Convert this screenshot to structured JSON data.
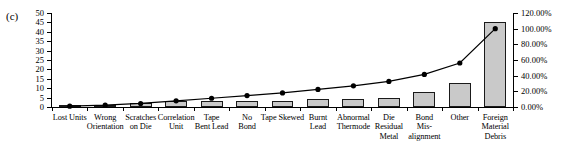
{
  "panel": {
    "label": "(c)"
  },
  "chart_data": {
    "type": "bar",
    "title": "",
    "subtitle": "",
    "xlabel": "",
    "ylabel": "",
    "grid": false,
    "legend": "none",
    "categories": [
      "Lost Units",
      "Wrong Orientation",
      "Scratches on Die",
      "Correlation Unit",
      "Tape Bent Lead",
      "No Bond",
      "Tape Skewed",
      "Burnt Lead",
      "Abnormal Thermode",
      "Die Residual Metal",
      "Bond Mis-alignment",
      "Other",
      "Foreign Material Debris"
    ],
    "category_lines": [
      [
        "Lost Units"
      ],
      [
        "Wrong",
        "Orientation"
      ],
      [
        "Scratches",
        "on Die"
      ],
      [
        "Correlation",
        "Unit"
      ],
      [
        "Tape",
        "Bent Lead"
      ],
      [
        "No",
        "Bond"
      ],
      [
        "Tape Skewed"
      ],
      [
        "Burnt",
        "Lead"
      ],
      [
        "Abnormal",
        "Thermode"
      ],
      [
        "Die",
        "Residual",
        "Metal"
      ],
      [
        "Bond",
        "Mis-",
        "alignment"
      ],
      [
        "Other"
      ],
      [
        "Foreign",
        "Material",
        "Debris"
      ]
    ],
    "series": [
      {
        "name": "Count",
        "type": "bar",
        "axis": "left",
        "values": [
          1,
          1,
          2,
          3,
          3,
          3,
          3,
          4,
          4,
          5,
          8,
          13,
          45
        ]
      },
      {
        "name": "Cumulative Percentage",
        "type": "line",
        "axis": "right",
        "values": [
          1.1,
          2.3,
          4.5,
          7.9,
          11.2,
          14.6,
          18.0,
          22.5,
          27.0,
          32.6,
          41.6,
          56.2,
          100.0
        ]
      }
    ],
    "left_axis": {
      "min": 0,
      "max": 50,
      "step": 5,
      "ticks": [
        "0",
        "5",
        "10",
        "15",
        "20",
        "25",
        "30",
        "35",
        "40",
        "45",
        "50"
      ]
    },
    "right_axis": {
      "min": 0,
      "max": 120,
      "step": 20,
      "ticks": [
        "0.00%",
        "20.00%",
        "40.00%",
        "60.00%",
        "80.00%",
        "100.00%",
        "120.00%"
      ]
    },
    "colors": {
      "bar_fill": "#c9c9c9",
      "bar_border": "#1a1a1a",
      "line": "#000000",
      "marker": "#000000",
      "axis": "#000000",
      "background": "#ffffff"
    }
  }
}
